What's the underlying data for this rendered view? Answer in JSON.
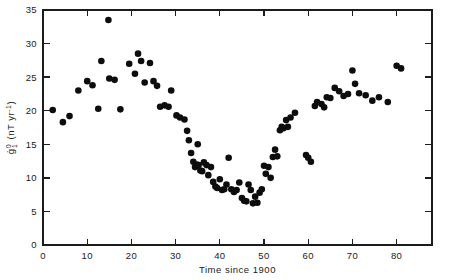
{
  "figure": {
    "background_color": "#ffffff",
    "point_color": "#0d0d0d",
    "axis_color": "#1c1c1c"
  },
  "chart_data": {
    "type": "scatter",
    "title": "",
    "xlabel": "Time since 1900",
    "ylabel": "ġ₁⁰ (nT yr⁻¹)",
    "ylabel_parts": {
      "symbol": "g",
      "dot": "̇",
      "subscript": "1",
      "superscript": "0",
      "units": "(nT yr",
      "units_exponent": "-1",
      "units_close": ")"
    },
    "xlim": [
      0,
      88
    ],
    "ylim": [
      0,
      35
    ],
    "xticks": [
      0,
      10,
      20,
      30,
      40,
      50,
      60,
      70,
      80
    ],
    "xtick_labels": [
      "0",
      "10",
      "20",
      "30",
      "40",
      "50",
      "60",
      "70",
      "80"
    ],
    "yticks": [
      0,
      5,
      10,
      15,
      20,
      25,
      30,
      35
    ],
    "ytick_labels": [
      "0",
      "5",
      "10",
      "15",
      "20",
      "25",
      "30",
      "35"
    ],
    "grid": false,
    "legend": null,
    "marker": "circle",
    "marker_size_px": 3.3,
    "x": [
      2.2,
      4.5,
      6.0,
      8.0,
      10.0,
      11.2,
      12.5,
      13.2,
      14.8,
      15.0,
      16.2,
      17.5,
      19.5,
      20.8,
      21.5,
      22.2,
      23.0,
      24.2,
      25.0,
      25.8,
      26.5,
      27.5,
      28.4,
      29.0,
      30.2,
      31.0,
      32.0,
      32.6,
      33.0,
      33.5,
      34.0,
      34.4,
      34.8,
      35.0,
      35.2,
      35.6,
      36.0,
      36.4,
      37.0,
      37.4,
      38.0,
      38.5,
      39.0,
      39.4,
      40.0,
      40.5,
      41.0,
      41.5,
      42.0,
      42.6,
      43.2,
      43.8,
      44.4,
      45.0,
      45.5,
      46.0,
      46.5,
      47.0,
      47.5,
      48.0,
      48.5,
      49.0,
      49.5,
      50.0,
      50.4,
      51.0,
      51.5,
      52.0,
      52.5,
      53.0,
      53.6,
      54.0,
      54.4,
      55.0,
      55.4,
      56.0,
      57.0,
      59.5,
      60.0,
      60.6,
      61.5,
      62.0,
      63.0,
      63.6,
      64.2,
      65.0,
      66.0,
      67.0,
      68.0,
      69.0,
      70.0,
      70.6,
      71.5,
      73.0,
      74.5,
      76.0,
      78.0,
      80.0,
      81.0
    ],
    "y": [
      20.1,
      18.3,
      19.2,
      23.0,
      24.4,
      23.8,
      20.3,
      27.4,
      33.5,
      24.8,
      24.6,
      20.2,
      27.0,
      25.5,
      28.5,
      27.4,
      24.2,
      27.1,
      24.4,
      23.7,
      20.6,
      20.8,
      20.6,
      23.0,
      19.3,
      19.0,
      18.7,
      17.0,
      15.6,
      13.7,
      12.4,
      11.6,
      12.0,
      15.0,
      11.9,
      11.1,
      11.0,
      12.3,
      11.9,
      10.4,
      11.6,
      9.4,
      8.7,
      8.5,
      9.8,
      8.2,
      8.3,
      9.0,
      13.0,
      8.3,
      7.9,
      8.2,
      9.3,
      7.0,
      6.6,
      6.5,
      9.0,
      8.2,
      6.2,
      7.2,
      6.3,
      7.8,
      8.3,
      11.8,
      10.6,
      11.6,
      10.0,
      13.1,
      14.2,
      13.2,
      17.1,
      17.6,
      17.4,
      18.6,
      17.6,
      19.0,
      19.7,
      13.4,
      13.0,
      12.4,
      20.7,
      21.3,
      21.0,
      20.5,
      22.0,
      21.9,
      23.4,
      22.9,
      22.2,
      22.5,
      26.0,
      24.0,
      22.6,
      22.3,
      21.5,
      22.0,
      21.3,
      26.7,
      26.3
    ]
  }
}
